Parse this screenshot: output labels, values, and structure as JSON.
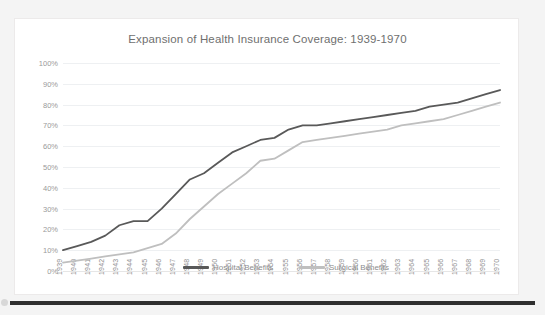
{
  "chart_data": {
    "type": "line",
    "title": "Expansion of Health Insurance Coverage: 1939-1970",
    "xlabel": "",
    "ylabel": "",
    "ylim": [
      0,
      100
    ],
    "ytick_labels": [
      "0%",
      "10%",
      "20%",
      "30%",
      "40%",
      "50%",
      "60%",
      "70%",
      "80%",
      "90%",
      "100%"
    ],
    "ytick_values": [
      0,
      10,
      20,
      30,
      40,
      50,
      60,
      70,
      80,
      90,
      100
    ],
    "grid": true,
    "legend_position": "inside-bottom-center",
    "categories": [
      "1939",
      "1940",
      "1941",
      "1942",
      "1943",
      "1944",
      "1945",
      "1946",
      "1947",
      "1948",
      "1949",
      "1950",
      "1951",
      "1952",
      "1953",
      "1954",
      "1955",
      "1956",
      "1957",
      "1958",
      "1959",
      "1960",
      "1961",
      "1962",
      "1963",
      "1964",
      "1965",
      "1966",
      "1967",
      "1968",
      "1969",
      "1970"
    ],
    "series": [
      {
        "name": "Hospital Benefits",
        "color": "#595959",
        "values": [
          10,
          12,
          14,
          17,
          22,
          24,
          24,
          30,
          37,
          44,
          47,
          52,
          57,
          60,
          63,
          64,
          68,
          70,
          70,
          71,
          72,
          73,
          74,
          75,
          76,
          77,
          79,
          80,
          81,
          83,
          85,
          87
        ]
      },
      {
        "name": "Surgical Benefits",
        "color": "#bfbfbf",
        "values": [
          4,
          5,
          6,
          7,
          8,
          9,
          11,
          13,
          18,
          25,
          31,
          37,
          42,
          47,
          53,
          54,
          58,
          62,
          63,
          64,
          65,
          66,
          67,
          68,
          70,
          71,
          72,
          73,
          75,
          77,
          79,
          81
        ]
      }
    ]
  },
  "chart": {
    "title": "Expansion of Health Insurance Coverage: 1939-1970"
  },
  "legend": {
    "items": [
      {
        "label": "Hospital Benefits"
      },
      {
        "label": "Surgical Benefits"
      }
    ]
  }
}
